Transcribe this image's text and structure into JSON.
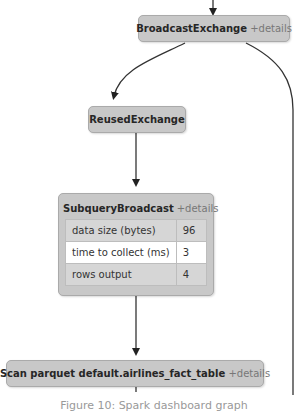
{
  "graph": {
    "nodes": [
      {
        "id": "broadcast-exchange",
        "title": "BroadcastExchange",
        "details_label": "+details"
      },
      {
        "id": "reused-exchange",
        "title": "ReusedExchange"
      },
      {
        "id": "subquery-broadcast",
        "title": "SubqueryBroadcast",
        "details_label": "+details",
        "metrics": [
          {
            "label": "data size (bytes)",
            "value": "96"
          },
          {
            "label": "time to collect (ms)",
            "value": "3"
          },
          {
            "label": "rows output",
            "value": "4"
          }
        ]
      },
      {
        "id": "scan-parquet",
        "title": "Scan parquet default.airlines_fact_table",
        "details_label": "+details"
      }
    ],
    "edge_color": "#333333",
    "node_color": "#c8c8c8"
  },
  "caption": "Figure 10: Spark dashboard graph"
}
